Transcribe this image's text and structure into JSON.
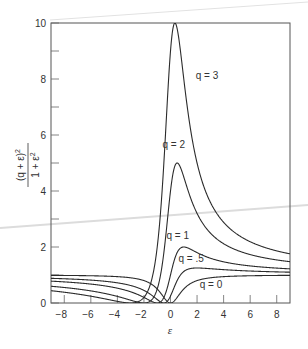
{
  "chart_data": {
    "type": "line",
    "title": "",
    "xlabel": "ε",
    "ylabel": "(q + ε)² / (1 + ε²)",
    "ylabel_numerator": "(q + ε)",
    "ylabel_numerator_exp": "2",
    "ylabel_denominator": "1 + ε",
    "ylabel_denominator_exp": "2",
    "xlim": [
      -9,
      9
    ],
    "ylim": [
      0,
      10
    ],
    "x_ticks": [
      -8,
      -6,
      -4,
      -2,
      0,
      2,
      4,
      6,
      8
    ],
    "x_tick_labels": [
      "−8",
      "−6",
      "−4",
      "−2",
      "0",
      "2",
      "4",
      "6",
      "8"
    ],
    "y_ticks": [
      0,
      1,
      2,
      3,
      4,
      5,
      6,
      7,
      8,
      9,
      10
    ],
    "y_tick_labels": [
      "0",
      "",
      "2",
      "",
      "4",
      "",
      "6",
      "",
      "8",
      "",
      "10"
    ],
    "grid": false,
    "legend": "inline curve labels",
    "formula": "(q+ε)^2/(1+ε^2)",
    "series": [
      {
        "name": "q = 0",
        "q": 0,
        "label": "q = 0",
        "label_pos": [
          2.2,
          0.55
        ]
      },
      {
        "name": "q = .5",
        "q": 0.5,
        "label": "q = .5",
        "label_pos": [
          0.6,
          1.45
        ]
      },
      {
        "name": "q = 1",
        "q": 1,
        "label": "q = 1",
        "label_pos": [
          -0.3,
          2.3
        ]
      },
      {
        "name": "q = 2",
        "q": 2,
        "label": "q = 2",
        "label_pos": [
          -0.6,
          5.55
        ]
      },
      {
        "name": "q = 3",
        "q": 3,
        "label": "q = 3",
        "label_pos": [
          1.9,
          8.0
        ]
      }
    ],
    "sample_points": {
      "x": [
        -9,
        -8,
        -6,
        -4,
        -2,
        -1,
        0,
        0.33,
        0.5,
        1,
        2,
        4,
        6,
        8,
        9
      ],
      "q = 0": [
        0.99,
        0.98,
        0.97,
        0.94,
        0.8,
        0.5,
        0,
        0.1,
        0.2,
        0.5,
        0.8,
        0.94,
        0.97,
        0.98,
        0.99
      ],
      "q = .5": [
        0.84,
        0.83,
        0.8,
        0.72,
        0.45,
        0.13,
        0.25,
        0.62,
        0.8,
        1.13,
        1.25,
        1.15,
        1.12,
        1.09,
        1.09
      ],
      "q = 1": [
        0.79,
        0.75,
        0.68,
        0.53,
        0.2,
        0,
        1,
        1.6,
        1.8,
        2.0,
        1.8,
        1.47,
        1.32,
        1.25,
        1.21
      ],
      "q = 2": [
        0.6,
        0.57,
        0.44,
        0.24,
        0,
        0.5,
        4,
        4.9,
        5.0,
        4.5,
        3.2,
        2.12,
        1.73,
        1.55,
        1.48
      ],
      "q = 3": [
        0.44,
        0.42,
        0.24,
        0.06,
        0.2,
        2.0,
        9,
        10.0,
        9.8,
        8.0,
        5.0,
        2.88,
        2.19,
        1.86,
        1.75
      ]
    }
  },
  "colors": {
    "curve": "#2b2b2b",
    "axis": "#555555",
    "text": "#333333",
    "artifact_line": "#d8d8d8"
  }
}
